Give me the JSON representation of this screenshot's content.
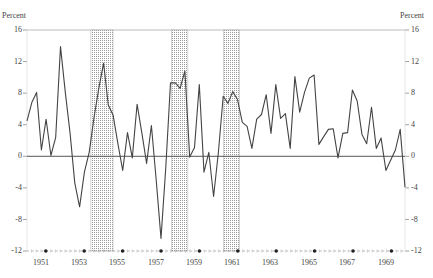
{
  "chart_data": {
    "type": "line",
    "title": "",
    "ylabel_left": "Percent",
    "ylabel_right": "Percent",
    "xlabel": "",
    "ylim": [
      -12,
      16
    ],
    "yticks": [
      16,
      12,
      8,
      4,
      0,
      -4,
      -8,
      -12
    ],
    "xticks": [
      "1951",
      "1953",
      "1955",
      "1957",
      "1959",
      "1961",
      "1963",
      "1965",
      "1967",
      "1969"
    ],
    "x_range": [
      "1950Q1",
      "1970Q1"
    ],
    "grid": false,
    "frequency": "quarterly",
    "shaded_recessions": [
      {
        "start": 1953.35,
        "end": 1954.5
      },
      {
        "start": 1957.55,
        "end": 1958.4
      },
      {
        "start": 1960.25,
        "end": 1961.1
      },
      {
        "start": 1969.85,
        "end": 1970.9
      }
    ],
    "series": [
      {
        "name": "Percent change",
        "x_start": 1950.0,
        "x_step": 0.25,
        "values": [
          4.5,
          6.8,
          8.1,
          0.8,
          4.7,
          0.1,
          2.4,
          13.9,
          8.1,
          2.9,
          -3.4,
          -6.4,
          -2.0,
          0.5,
          4.9,
          8.6,
          11.8,
          6.5,
          5.2,
          1.6,
          -1.8,
          3.0,
          -0.2,
          6.6,
          3.0,
          -0.9,
          3.9,
          -3.0,
          -10.4,
          -1.4,
          9.3,
          9.3,
          8.6,
          10.8,
          -0.1,
          1.1,
          9.1,
          -2.0,
          0.5,
          -5.1,
          0.5,
          7.6,
          6.7,
          8.2,
          7.2,
          4.3,
          3.8,
          1.0,
          4.7,
          5.3,
          7.8,
          2.9,
          9.1,
          4.8,
          5.4,
          1.0,
          10.1,
          5.6,
          8.1,
          9.9,
          10.3,
          1.5,
          2.5,
          3.4,
          3.5,
          -0.2,
          2.9,
          3.0,
          8.4,
          7.0,
          2.8,
          1.6,
          6.2,
          1.0,
          2.3,
          -1.8,
          -0.5,
          0.8,
          3.4,
          -3.9
        ]
      }
    ]
  },
  "labels": {
    "ylabel_left": "Percent",
    "ylabel_right": "Percent",
    "yticks": [
      "16",
      "12",
      "8",
      "4",
      "0",
      "-4",
      "-8",
      "-12"
    ],
    "xticks": [
      "1951",
      "1953",
      "1955",
      "1957",
      "1959",
      "1961",
      "1963",
      "1965",
      "1967",
      "1969"
    ]
  }
}
